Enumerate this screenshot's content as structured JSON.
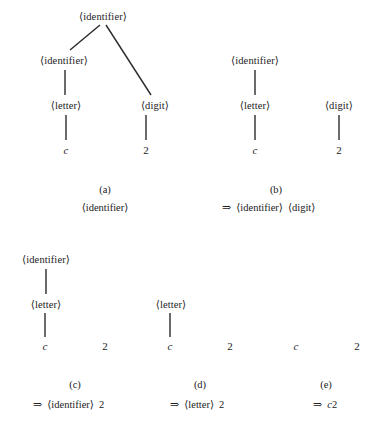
{
  "figure": {
    "symbols": {
      "identifier": "⟨identifier⟩",
      "letter": "⟨letter⟩",
      "digit": "⟨digit⟩",
      "arrow": "⇒",
      "terminal_c": "c",
      "terminal_2": "2"
    }
  },
  "panels": [
    {
      "key": "a",
      "label": "(a)",
      "caption_text": "⟨identifier⟩",
      "caption_arrow": "",
      "nodes": [
        {
          "name": "root-identifier",
          "text": "⟨identifier⟩"
        },
        {
          "name": "child-identifier",
          "text": "⟨identifier⟩"
        },
        {
          "name": "letter",
          "text": "⟨letter⟩"
        },
        {
          "name": "digit",
          "text": "⟨digit⟩"
        },
        {
          "name": "terminal-c",
          "text": "c"
        },
        {
          "name": "terminal-2",
          "text": "2"
        }
      ]
    },
    {
      "key": "b",
      "label": "(b)",
      "caption_arrow": "⇒",
      "caption_text": "⟨identifier⟩ ⟨digit⟩",
      "caption_part1": "⟨identifier⟩",
      "caption_part2": "⟨digit⟩",
      "nodes": [
        {
          "name": "identifier",
          "text": "⟨identifier⟩"
        },
        {
          "name": "letter",
          "text": "⟨letter⟩"
        },
        {
          "name": "digit",
          "text": "⟨digit⟩"
        },
        {
          "name": "terminal-c",
          "text": "c"
        },
        {
          "name": "terminal-2",
          "text": "2"
        }
      ]
    },
    {
      "key": "c",
      "label": "(c)",
      "caption_arrow": "⇒",
      "caption_text": "⟨identifier⟩ 2",
      "caption_part1": "⟨identifier⟩",
      "caption_part2": "2",
      "nodes": [
        {
          "name": "identifier",
          "text": "⟨identifier⟩"
        },
        {
          "name": "letter",
          "text": "⟨letter⟩"
        },
        {
          "name": "terminal-c",
          "text": "c"
        },
        {
          "name": "terminal-2",
          "text": "2"
        }
      ]
    },
    {
      "key": "d",
      "label": "(d)",
      "caption_arrow": "⇒",
      "caption_text": "⟨letter⟩ 2",
      "caption_part1": "⟨letter⟩",
      "caption_part2": "2",
      "nodes": [
        {
          "name": "letter",
          "text": "⟨letter⟩"
        },
        {
          "name": "terminal-c",
          "text": "c"
        },
        {
          "name": "terminal-2",
          "text": "2"
        }
      ]
    },
    {
      "key": "e",
      "label": "(e)",
      "caption_arrow": "⇒",
      "caption_text": "c2",
      "caption_part1": "c",
      "caption_part2": "2",
      "nodes": [
        {
          "name": "terminal-c",
          "text": "c"
        },
        {
          "name": "terminal-2",
          "text": "2"
        }
      ]
    }
  ],
  "tree_a": {
    "root": "⟨identifier⟩",
    "left_child": "⟨identifier⟩",
    "letter": "⟨letter⟩",
    "digit": "⟨digit⟩",
    "leaf_c": "c",
    "leaf_2": "2"
  },
  "tree_b": {
    "identifier": "⟨identifier⟩",
    "letter": "⟨letter⟩",
    "digit": "⟨digit⟩",
    "leaf_c": "c",
    "leaf_2": "2"
  },
  "tree_c": {
    "identifier": "⟨identifier⟩",
    "letter": "⟨letter⟩",
    "leaf_c": "c",
    "leaf_2": "2"
  },
  "tree_d": {
    "letter": "⟨letter⟩",
    "leaf_c": "c",
    "leaf_2": "2"
  },
  "tree_e": {
    "leaf_c": "c",
    "leaf_2": "2"
  },
  "labels": {
    "a": "(a)",
    "b": "(b)",
    "c": "(c)",
    "d": "(d)",
    "e": "(e)"
  },
  "captions": {
    "a_text": "⟨identifier⟩",
    "b_arrow": "⇒",
    "b_p1": "⟨identifier⟩",
    "b_p2": "⟨digit⟩",
    "c_arrow": "⇒",
    "c_p1": "⟨identifier⟩",
    "c_p2": "2",
    "d_arrow": "⇒",
    "d_p1": "⟨letter⟩",
    "d_p2": "2",
    "e_arrow": "⇒",
    "e_p1": "c",
    "e_p2": "2"
  },
  "colors": {
    "background": "#ffffff",
    "text": "#222222",
    "edge": "#2b2b2b"
  }
}
